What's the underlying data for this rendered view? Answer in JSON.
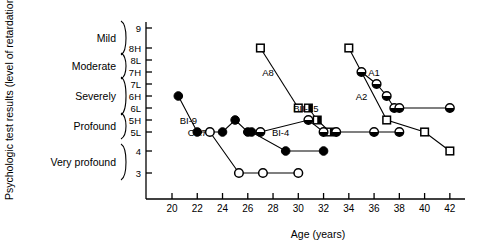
{
  "chart_data": {
    "type": "scatter",
    "title": "",
    "xlabel": "Age (years)",
    "ylabel": "Psychologic test results (level of retardation)",
    "xlim": [
      19,
      43
    ],
    "xticks": [
      20,
      22,
      24,
      26,
      28,
      30,
      32,
      34,
      36,
      38,
      40,
      42
    ],
    "yticks": [
      "9",
      "8H",
      "8L",
      "7H",
      "7L",
      "6H",
      "6L",
      "5H",
      "5L",
      "4",
      "3"
    ],
    "y_categories": [
      {
        "label": "Mild",
        "levels": [
          "9",
          "8H"
        ]
      },
      {
        "label": "Moderate",
        "levels": [
          "8L",
          "7H"
        ]
      },
      {
        "label": "Severely",
        "levels": [
          "7L",
          "6H",
          "6L"
        ]
      },
      {
        "label": "Profound",
        "levels": [
          "5H",
          "5L"
        ]
      },
      {
        "label": "Very profound",
        "levels": [
          "4",
          "3"
        ]
      }
    ],
    "grid": false,
    "legend": "none",
    "marker_types": {
      "filled-circle": "solid black circle",
      "open-circle": "open white circle",
      "half-circle": "half-filled circle",
      "open-square": "open white square",
      "half-square": "half-filled square"
    },
    "series": [
      {
        "name": "BI-9",
        "marker": "filled-circle",
        "label_x": 21.3,
        "label_y": "5H",
        "points": [
          {
            "x": 20.5,
            "y": "6H"
          },
          {
            "x": 22.0,
            "y": "5L"
          },
          {
            "x": 24.0,
            "y": "5L"
          },
          {
            "x": 25.0,
            "y": "5H"
          },
          {
            "x": 26.0,
            "y": "5L"
          },
          {
            "x": 26.3,
            "y": "5L"
          },
          {
            "x": 29.0,
            "y": "4"
          },
          {
            "x": 32.0,
            "y": "4"
          }
        ]
      },
      {
        "name": "OA7",
        "marker": "open-circle",
        "label_x": 22.0,
        "label_y": "5L",
        "points": [
          {
            "x": 23.0,
            "y": "5L"
          },
          {
            "x": 25.3,
            "y": "3"
          },
          {
            "x": 27.2,
            "y": "3"
          },
          {
            "x": 30.0,
            "y": "3"
          }
        ]
      },
      {
        "name": "A8",
        "marker": "open-square",
        "label_x": 27.6,
        "label_y": "7H",
        "points": [
          {
            "x": 27.0,
            "y": "8H"
          },
          {
            "x": 30.0,
            "y": "6L"
          }
        ]
      },
      {
        "name": "BII-15",
        "marker": "half-square",
        "label_x": 30.6,
        "label_y": "6L",
        "points": [
          {
            "x": 30.8,
            "y": "6L"
          },
          {
            "x": 31.5,
            "y": "5H"
          },
          {
            "x": 32.5,
            "y": "5L"
          }
        ]
      },
      {
        "name": "BI-4",
        "marker": "half-circle",
        "label_x": 28.6,
        "label_y": "5L",
        "points": [
          {
            "x": 27.0,
            "y": "5L"
          },
          {
            "x": 30.8,
            "y": "5H"
          },
          {
            "x": 32.0,
            "y": "5L"
          },
          {
            "x": 33.0,
            "y": "5L"
          },
          {
            "x": 36.0,
            "y": "5L"
          },
          {
            "x": 38.0,
            "y": "5L"
          }
        ]
      },
      {
        "name": "A1",
        "marker": "half-circle",
        "label_x": 36.0,
        "label_y": "7H",
        "points": [
          {
            "x": 35.0,
            "y": "7H"
          },
          {
            "x": 36.2,
            "y": "7L"
          },
          {
            "x": 37.0,
            "y": "6H"
          },
          {
            "x": 37.6,
            "y": "6L"
          },
          {
            "x": 38.0,
            "y": "6L"
          },
          {
            "x": 42.0,
            "y": "6L"
          }
        ]
      },
      {
        "name": "A2",
        "marker": "open-square",
        "label_x": 35.0,
        "label_y": "6H",
        "points": [
          {
            "x": 34.0,
            "y": "8H"
          },
          {
            "x": 37.0,
            "y": "5H"
          },
          {
            "x": 40.0,
            "y": "5L"
          },
          {
            "x": 42.0,
            "y": "4"
          }
        ]
      }
    ]
  },
  "colors": {
    "axis": "#000000",
    "marker_fill": "#000000",
    "marker_open": "#ffffff"
  }
}
